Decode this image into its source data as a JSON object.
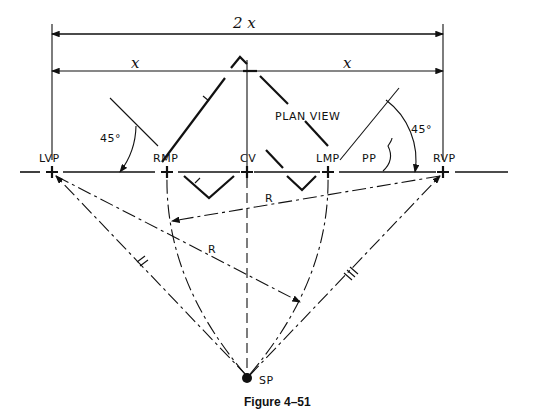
{
  "figure": {
    "caption": "Figure 4–51",
    "dimensions": {
      "total": "2 x",
      "left_half": "x",
      "right_half": "x"
    },
    "plan_view_label": "PLAN VIEW",
    "picture_plane_label": "PP",
    "angles": {
      "left": "45°",
      "right": "45°"
    },
    "points": {
      "lvp": "LVP",
      "rmp": "RMP",
      "cv": "CV",
      "lmp": "LMP",
      "rvp": "RVP",
      "sp": "SP"
    },
    "radius_labels": {
      "upper": "R",
      "lower": "R"
    }
  }
}
